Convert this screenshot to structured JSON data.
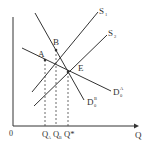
{
  "diagram": {
    "type": "supply-demand",
    "colors": {
      "line": "#333333",
      "dashed": "#444444",
      "background": "#ffffff"
    },
    "axes": {
      "origin_label": "0",
      "x_label": "Q",
      "ticks": [
        {
          "main": "Q",
          "sub": "A"
        },
        {
          "main": "Q",
          "sub": "B"
        },
        {
          "main": "Q*",
          "sub": ""
        }
      ]
    },
    "curves": {
      "S1": {
        "main": "S",
        "sub": "1"
      },
      "S2": {
        "main": "S",
        "sub": "2"
      },
      "DA": {
        "main": "D",
        "sup": "A",
        "sub": "0"
      },
      "DB": {
        "main": "D",
        "sup": "B",
        "sub": "0"
      }
    },
    "points": {
      "A": "A",
      "B": "B",
      "E": "E"
    }
  }
}
